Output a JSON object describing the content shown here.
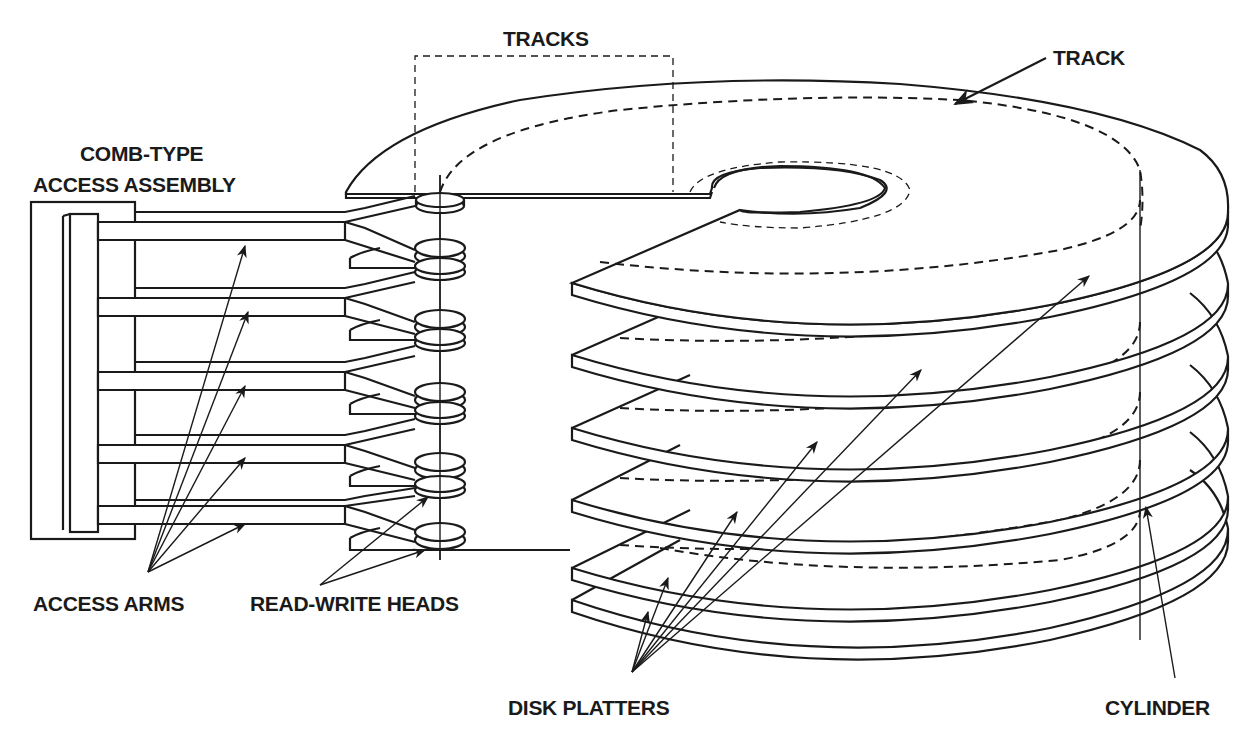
{
  "figure": {
    "labels": {
      "tracks": "TRACKS",
      "track": "TRACK",
      "comb_line1": "COMB-TYPE",
      "comb_line2": "ACCESS ASSEMBLY",
      "access_arms": "ACCESS ARMS",
      "read_write_heads": "READ-WRITE HEADS",
      "disk_platters": "DISK PLATTERS",
      "cylinder": "CYLINDER"
    },
    "counts": {
      "platters": 6,
      "access_arms": 6,
      "read_write_heads": 6
    },
    "colors": {
      "ink": "#1a1a1a",
      "paper": "#ffffff"
    }
  }
}
